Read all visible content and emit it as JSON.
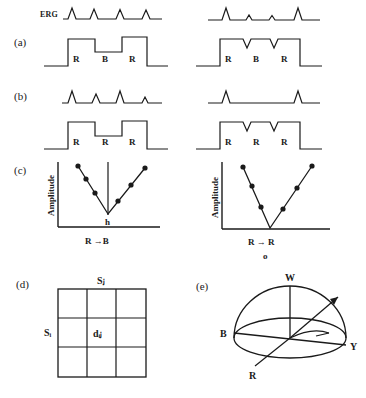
{
  "figure": {
    "background": "#ffffff",
    "ink": "#1a1a1a",
    "width": 366,
    "height": 398
  },
  "panels": [
    {
      "id": "a",
      "label": "(a)",
      "trace_label": "ERG",
      "left": {
        "erg_peaks": [
          {
            "height": "tall"
          },
          {
            "height": "tall"
          },
          {
            "height": "tall"
          },
          {
            "height": "tall"
          }
        ],
        "stimulus_labels": [
          "R",
          "B",
          "R"
        ],
        "stimulus_shape": "square-pulses-with-mid-step"
      },
      "right": {
        "erg_peaks": [
          {
            "height": "tall"
          },
          {
            "height": "small"
          },
          {
            "height": "small"
          },
          {
            "height": "tall"
          }
        ],
        "stimulus_labels": [
          "R",
          "B",
          "R"
        ],
        "stimulus_shape": "plateau-with-notches"
      }
    },
    {
      "id": "b",
      "label": "(b)",
      "left": {
        "erg_peaks": [
          {
            "height": "tall"
          },
          {
            "height": "medium"
          },
          {
            "height": "tall"
          },
          {
            "height": "small"
          }
        ],
        "stimulus_labels": [
          "R",
          "R",
          "R"
        ],
        "stimulus_shape": "square-pulses-with-mid-step"
      },
      "right": {
        "erg_peaks": [
          {
            "height": "tall"
          },
          {
            "height": "tall"
          }
        ],
        "stimulus_labels": [
          "R",
          "R",
          "R"
        ],
        "stimulus_shape": "plateau-with-notches"
      }
    },
    {
      "id": "c",
      "label": "(c)",
      "left": {
        "ylabel": "Amplitude",
        "xlabel": "R →B",
        "vertex_label": "h",
        "has_vertical_vertex_line": true,
        "left_arm_points": 3,
        "right_arm_points": 3
      },
      "right": {
        "ylabel": "Amplitude",
        "xlabel": "R → R",
        "vertex_label": "",
        "has_vertical_vertex_line": false,
        "left_arm_points": 3,
        "right_arm_points": 3,
        "marker_below": "o"
      }
    },
    {
      "id": "d",
      "label": "(d)",
      "grid": {
        "rows": 3,
        "cols": 3,
        "top_label": "Sⱼ",
        "left_label": "Sᵢ",
        "center_label": "dᵢⱼ"
      }
    },
    {
      "id": "e",
      "label": "(e)",
      "sphere": {
        "axis_labels": {
          "top": "W",
          "left": "B",
          "right": "Y",
          "front": "R"
        },
        "has_vector_arrow": true,
        "has_azimuth_arc": true
      }
    }
  ]
}
